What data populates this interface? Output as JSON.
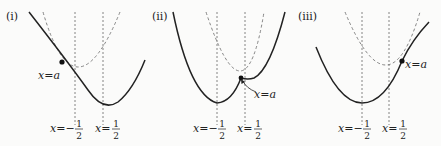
{
  "panels": [
    {
      "id": "i",
      "label": "(i)",
      "point_label": "x=a",
      "left_line_label": {
        "prefix": "x=−",
        "num": "1",
        "den": "2"
      },
      "right_line_label": {
        "prefix": "x=",
        "num": "1",
        "den": "2"
      },
      "description": "Point x=a lies left of x=−1/2; solid parabola with vertex at x=1/2, dashed parabola with vertex at x=−1/2"
    },
    {
      "id": "ii",
      "label": "(ii)",
      "point_label": "x=a",
      "left_line_label": {
        "prefix": "x=−",
        "num": "1",
        "den": "2"
      },
      "right_line_label": {
        "prefix": "x=",
        "num": "1",
        "den": "2"
      },
      "description": "Point x=a lies between x=−1/2 and x=1/2; solid parabola with vertex at x=−1/2, dashed parabola with vertex at x=1/2"
    },
    {
      "id": "iii",
      "label": "(iii)",
      "point_label": "x=a",
      "left_line_label": {
        "prefix": "x=−",
        "num": "1",
        "den": "2"
      },
      "right_line_label": {
        "prefix": "x=",
        "num": "1",
        "den": "2"
      },
      "description": "Point x=a lies right of x=1/2; solid parabola with vertex at x=−1/2, dashed parabola with vertex at x=1/2"
    }
  ],
  "colors": {
    "ink": "#222222",
    "dashed": "#777777",
    "background": "#fbfbfa"
  }
}
